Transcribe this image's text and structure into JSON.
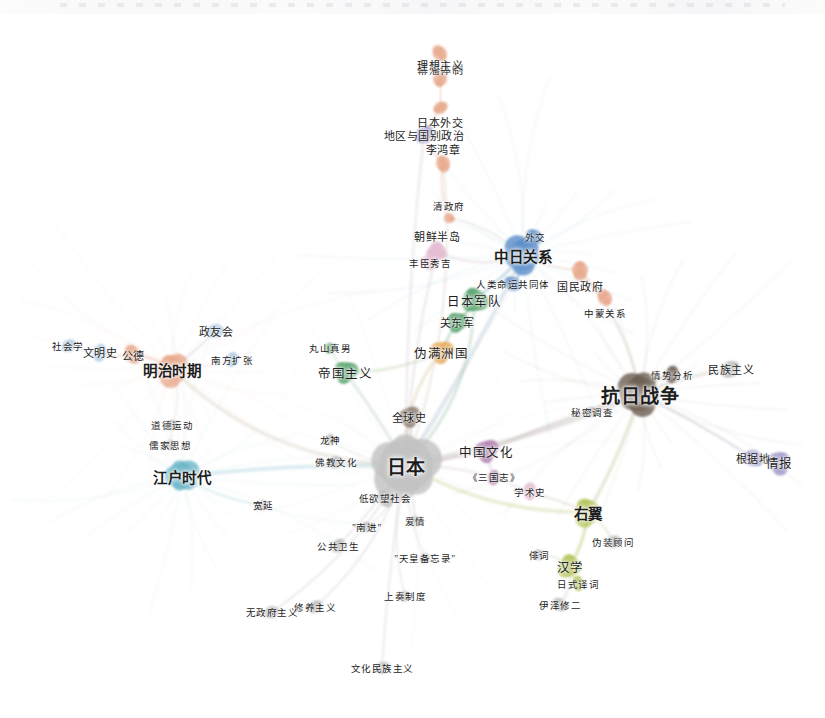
{
  "figure": {
    "type": "network-graph",
    "title": "",
    "background": "#ffffff",
    "width": 825,
    "height": 718
  },
  "palette": {
    "grey": "#b4b4b4",
    "grey_dark": "#9a9a9a",
    "salmon": "#e8a98d",
    "salmon_deep": "#dd9274",
    "blue": "#5b8fc9",
    "blue_light": "#a8c6e2",
    "green": "#58a36d",
    "green_light": "#9dc9a8",
    "orange": "#e8ab5a",
    "pink": "#e3bdd2",
    "mauve": "#b07fae",
    "brown": "#8a7a6d",
    "brown_dark": "#6e5f53",
    "olive": "#b5c45a",
    "purple": "#9a95c8",
    "teal": "#6fb7c9",
    "text": "#1d1d1d"
  },
  "chart_data": {
    "type": "network",
    "node_count": 48,
    "clusters": [
      {
        "name": "core-japan",
        "color": "#b4b4b4",
        "label": "日本"
      },
      {
        "name": "meiji-west",
        "color": "#e8a98d",
        "label": "明治时期"
      },
      {
        "name": "edo-blue",
        "color": "#6fb7c9",
        "label": "江户时代"
      },
      {
        "name": "sino-japanese-relations",
        "color": "#5b8fc9",
        "label": "中日关系"
      },
      {
        "name": "military-green",
        "color": "#58a36d",
        "label": "日本军队"
      },
      {
        "name": "manchukuo-orange",
        "color": "#e8ab5a",
        "label": "伪满洲国"
      },
      {
        "name": "war-brown",
        "color": "#6e5f53",
        "label": "抗日战争"
      },
      {
        "name": "rightwing-olive",
        "color": "#b5c45a",
        "label": "右翼"
      },
      {
        "name": "culture-mauve",
        "color": "#b07fae",
        "label": "中国文化"
      },
      {
        "name": "intel-purple",
        "color": "#9a95c8",
        "label": "情报"
      }
    ],
    "nodes": [
      {
        "id": "mufan",
        "label": "幕藩体制",
        "x": 440,
        "y": 54,
        "r": 7,
        "color": "#e8a98d",
        "size": "sm",
        "label_pos": "below"
      },
      {
        "id": "lixiang",
        "label": "理想主义",
        "x": 440,
        "y": 79,
        "r": 7,
        "color": "#e8a98d",
        "size": "sm",
        "label_pos": "above"
      },
      {
        "id": "ribenwj",
        "label": "日本外交",
        "x": 440,
        "y": 108,
        "r": 6,
        "color": "#e8a98d",
        "size": "sm",
        "label_pos": "below"
      },
      {
        "id": "diqu",
        "label": "地区与国别政治",
        "x": 424,
        "y": 135,
        "r": 8,
        "color": "#9a95c8",
        "size": "sm",
        "label_pos": "on"
      },
      {
        "id": "lihz",
        "label": "李鸿章",
        "x": 443,
        "y": 163,
        "r": 7,
        "color": "#e8a98d",
        "size": "sm",
        "label_pos": "above"
      },
      {
        "id": "qingzf",
        "label": "清政府",
        "x": 449,
        "y": 218,
        "r": 5,
        "color": "#e8a98d",
        "size": "xs",
        "label_pos": "above"
      },
      {
        "id": "chaoxian",
        "label": "朝鲜半岛",
        "x": 437,
        "y": 252,
        "r": 9,
        "color": "#e3bdd2",
        "size": "sm",
        "label_pos": "above"
      },
      {
        "id": "fengchen",
        "label": "丰臣秀吉",
        "x": 430,
        "y": 263,
        "r": 7,
        "color": "#e3bdd2",
        "size": "xs",
        "label_pos": "on"
      },
      {
        "id": "tiaoyue",
        "label": "外交",
        "x": 535,
        "y": 237,
        "r": 7,
        "color": "#5b8fc9",
        "size": "xs",
        "label_pos": "on"
      },
      {
        "id": "zhongri",
        "label": "中日关系",
        "x": 523,
        "y": 255,
        "r": 15,
        "color": "#5b8fc9",
        "size": "lg",
        "label_pos": "on"
      },
      {
        "id": "renlei",
        "label": "人类命运共同体",
        "x": 513,
        "y": 284,
        "r": 7,
        "color": "#5b8fc9",
        "size": "xs",
        "label_pos": "on"
      },
      {
        "id": "guomin",
        "label": "国民政府",
        "x": 580,
        "y": 270,
        "r": 8,
        "color": "#e8a98d",
        "size": "sm",
        "label_pos": "below"
      },
      {
        "id": "zhongmeng",
        "label": "中蒙关系",
        "x": 605,
        "y": 298,
        "r": 7,
        "color": "#e8a98d",
        "size": "xs",
        "label_pos": "below"
      },
      {
        "id": "junduiA",
        "label": "日本军队",
        "x": 474,
        "y": 300,
        "r": 11,
        "color": "#58a36d",
        "size": "md",
        "label_pos": "left"
      },
      {
        "id": "guandong",
        "label": "关东军",
        "x": 457,
        "y": 322,
        "r": 9,
        "color": "#58a36d",
        "size": "sm",
        "label_pos": "on"
      },
      {
        "id": "weiman",
        "label": "伪满洲国",
        "x": 441,
        "y": 352,
        "r": 10,
        "color": "#e8ab5a",
        "size": "md",
        "label_pos": "on"
      },
      {
        "id": "maruyama",
        "label": "丸山真男",
        "x": 330,
        "y": 348,
        "r": 5,
        "color": "#58a36d",
        "size": "xs",
        "label_pos": "on"
      },
      {
        "id": "diguo",
        "label": "帝国主义",
        "x": 345,
        "y": 372,
        "r": 10,
        "color": "#58a36d",
        "size": "md",
        "label_pos": "on"
      },
      {
        "id": "nanfang",
        "label": "南方扩张",
        "x": 232,
        "y": 360,
        "r": 6,
        "color": "#a8c6e2",
        "size": "xs",
        "label_pos": "on"
      },
      {
        "id": "zhengyou",
        "label": "政友会",
        "x": 216,
        "y": 331,
        "r": 7,
        "color": "#a8c6e2",
        "size": "sm",
        "label_pos": "on"
      },
      {
        "id": "mingzhi",
        "label": "明治时期",
        "x": 172,
        "y": 369,
        "r": 13,
        "color": "#e8a98d",
        "size": "lg",
        "label_pos": "on"
      },
      {
        "id": "gongde",
        "label": "公德",
        "x": 133,
        "y": 355,
        "r": 8,
        "color": "#e8a98d",
        "size": "sm",
        "label_pos": "on"
      },
      {
        "id": "wenmingshi",
        "label": "文明史",
        "x": 100,
        "y": 352,
        "r": 7,
        "color": "#a8c6e2",
        "size": "sm",
        "label_pos": "on"
      },
      {
        "id": "shehuixue",
        "label": "社会学",
        "x": 68,
        "y": 346,
        "r": 6,
        "color": "#a8c6e2",
        "size": "xs",
        "label_pos": "on"
      },
      {
        "id": "daode",
        "label": "道德运动",
        "x": 172,
        "y": 425,
        "r": 5,
        "color": "#b4b4b4",
        "size": "xs",
        "label_pos": "on"
      },
      {
        "id": "rujia",
        "label": "儒家思想",
        "x": 170,
        "y": 445,
        "r": 5,
        "color": "#b4b4b4",
        "size": "xs",
        "label_pos": "on"
      },
      {
        "id": "jiangshu",
        "label": "江户时代",
        "x": 182,
        "y": 476,
        "r": 13,
        "color": "#6fb7c9",
        "size": "lg",
        "label_pos": "on"
      },
      {
        "id": "quanqiushi",
        "label": "全球史",
        "x": 409,
        "y": 417,
        "r": 9,
        "color": "#8a7a6d",
        "size": "sm",
        "label_pos": "on"
      },
      {
        "id": "longshen",
        "label": "龙神",
        "x": 330,
        "y": 440,
        "r": 5,
        "color": "#b4b4b4",
        "size": "xs",
        "label_pos": "on"
      },
      {
        "id": "fojiao",
        "label": "佛教文化",
        "x": 336,
        "y": 462,
        "r": 6,
        "color": "#b4b4b4",
        "size": "xs",
        "label_pos": "on"
      },
      {
        "id": "riben",
        "label": "日本",
        "x": 406,
        "y": 465,
        "r": 27,
        "color": "#c2c2c2",
        "size": "xl",
        "label_pos": "on"
      },
      {
        "id": "zhongguowh",
        "label": "中国文化",
        "x": 486,
        "y": 451,
        "r": 10,
        "color": "#b07fae",
        "size": "md",
        "label_pos": "on"
      },
      {
        "id": "sanguozhi",
        "label": "《三国志》",
        "x": 494,
        "y": 477,
        "r": 6,
        "color": "#b07fae",
        "size": "xs",
        "label_pos": "on"
      },
      {
        "id": "diyuwang",
        "label": "低欲望社会",
        "x": 385,
        "y": 498,
        "r": 7,
        "color": "#b4b4b4",
        "size": "xs",
        "label_pos": "on"
      },
      {
        "id": "kuanyan",
        "label": "宽延",
        "x": 263,
        "y": 505,
        "r": 5,
        "color": "#b4b4b4",
        "size": "xs",
        "label_pos": "on"
      },
      {
        "id": "nanjin",
        "label": "\"南进\"",
        "x": 367,
        "y": 527,
        "r": 5,
        "color": "#b4b4b4",
        "size": "xs",
        "label_pos": "on"
      },
      {
        "id": "aiqing",
        "label": "爱情",
        "x": 415,
        "y": 521,
        "r": 5,
        "color": "#b4b4b4",
        "size": "xs",
        "label_pos": "on"
      },
      {
        "id": "gonggong",
        "label": "公共卫生",
        "x": 338,
        "y": 546,
        "r": 6,
        "color": "#b4b4b4",
        "size": "xs",
        "label_pos": "on"
      },
      {
        "id": "tianhuang",
        "label": "\"天皇备忘录\"",
        "x": 425,
        "y": 558,
        "r": 5,
        "color": "#b4b4b4",
        "size": "xs",
        "label_pos": "on"
      },
      {
        "id": "shangzou",
        "label": "上奏制度",
        "x": 405,
        "y": 596,
        "r": 5,
        "color": "#b4b4b4",
        "size": "xs",
        "label_pos": "on"
      },
      {
        "id": "xiuyang",
        "label": "修养主义",
        "x": 315,
        "y": 607,
        "r": 6,
        "color": "#b4b4b4",
        "size": "xs",
        "label_pos": "on"
      },
      {
        "id": "wuzhengfu",
        "label": "无政府主义",
        "x": 272,
        "y": 612,
        "r": 6,
        "color": "#b4b4b4",
        "size": "xs",
        "label_pos": "on"
      },
      {
        "id": "wenhuamz",
        "label": "文化民族主义",
        "x": 382,
        "y": 668,
        "r": 6,
        "color": "#b4b4b4",
        "size": "xs",
        "label_pos": "on"
      },
      {
        "id": "mimi",
        "label": "秘密调查",
        "x": 592,
        "y": 412,
        "r": 5,
        "color": "#b4b4b4",
        "size": "xs",
        "label_pos": "on"
      },
      {
        "id": "fenxi",
        "label": "情势分析",
        "x": 672,
        "y": 375,
        "r": 7,
        "color": "#6e5f53",
        "size": "xs",
        "label_pos": "on"
      },
      {
        "id": "kangri",
        "label": "抗日战争",
        "x": 640,
        "y": 394,
        "r": 17,
        "color": "#6e5f53",
        "size": "xl",
        "label_pos": "on"
      },
      {
        "id": "minzu",
        "label": "民族主义",
        "x": 731,
        "y": 369,
        "r": 8,
        "color": "#b4b4b4",
        "size": "sm",
        "label_pos": "on"
      },
      {
        "id": "genjudi",
        "label": "根据地",
        "x": 753,
        "y": 458,
        "r": 8,
        "color": "#9a95c8",
        "size": "sm",
        "label_pos": "on"
      },
      {
        "id": "qingbao",
        "label": "情报",
        "x": 779,
        "y": 462,
        "r": 10,
        "color": "#9a95c8",
        "size": "md",
        "label_pos": "on"
      },
      {
        "id": "xueshushi",
        "label": "学术史",
        "x": 530,
        "y": 492,
        "r": 7,
        "color": "#e3bdd2",
        "size": "xs",
        "label_pos": "on"
      },
      {
        "id": "youyi",
        "label": "右翼",
        "x": 588,
        "y": 512,
        "r": 12,
        "color": "#b5c45a",
        "size": "lg",
        "label_pos": "on"
      },
      {
        "id": "weizhuang",
        "label": "伪装顾问",
        "x": 613,
        "y": 542,
        "r": 6,
        "color": "#b4b4b4",
        "size": "xs",
        "label_pos": "on"
      },
      {
        "id": "paici",
        "label": "俳词",
        "x": 539,
        "y": 555,
        "r": 5,
        "color": "#b4b4b4",
        "size": "xs",
        "label_pos": "on"
      },
      {
        "id": "hanxue",
        "label": "汉学",
        "x": 570,
        "y": 566,
        "r": 10,
        "color": "#b5c45a",
        "size": "md",
        "label_pos": "on"
      },
      {
        "id": "rishi",
        "label": "日式译词",
        "x": 578,
        "y": 584,
        "r": 6,
        "color": "#b5c45a",
        "size": "xs",
        "label_pos": "on"
      },
      {
        "id": "yize",
        "label": "伊泽修二",
        "x": 560,
        "y": 605,
        "r": 6,
        "color": "#b4b4b4",
        "size": "xs",
        "label_pos": "on"
      }
    ],
    "edges": [
      {
        "source": "mufan",
        "target": "lixiang",
        "color": "#e8a98d"
      },
      {
        "source": "lixiang",
        "target": "ribenwj",
        "color": "#e8a98d"
      },
      {
        "source": "ribenwj",
        "target": "diqu",
        "color": "#e8a98d"
      },
      {
        "source": "diqu",
        "target": "lihz",
        "color": "#e8a98d"
      },
      {
        "source": "lihz",
        "target": "qingzf",
        "color": "#e8a98d"
      },
      {
        "source": "qingzf",
        "target": "zhongri",
        "color": "#cfc9bd"
      },
      {
        "source": "lihz",
        "target": "riben",
        "color": "#d9cfc6"
      },
      {
        "source": "diqu",
        "target": "riben",
        "color": "#d4cfd8"
      },
      {
        "source": "chaoxian",
        "target": "riben",
        "color": "#e0cfd8"
      },
      {
        "source": "chaoxian",
        "target": "zhongri",
        "color": "#dfd4d9"
      },
      {
        "source": "zhongri",
        "target": "renlei",
        "color": "#5b8fc9"
      },
      {
        "source": "zhongri",
        "target": "tiaoyue",
        "color": "#5b8fc9"
      },
      {
        "source": "zhongri",
        "target": "riben",
        "color": "#b9c7d6"
      },
      {
        "source": "zhongri",
        "target": "guomin",
        "color": "#d8c6bb"
      },
      {
        "source": "guomin",
        "target": "zhongmeng",
        "color": "#e8a98d"
      },
      {
        "source": "guomin",
        "target": "kangri",
        "color": "#cfc0b2"
      },
      {
        "source": "junduiA",
        "target": "guandong",
        "color": "#58a36d"
      },
      {
        "source": "guandong",
        "target": "weiman",
        "color": "#88bd96"
      },
      {
        "source": "junduiA",
        "target": "zhongri",
        "color": "#8fb3c8"
      },
      {
        "source": "weiman",
        "target": "riben",
        "color": "#ddc9a8"
      },
      {
        "source": "junduiA",
        "target": "riben",
        "color": "#aac7b2"
      },
      {
        "source": "diguo",
        "target": "maruyama",
        "color": "#9dc9a8"
      },
      {
        "source": "diguo",
        "target": "riben",
        "color": "#bdd2c2"
      },
      {
        "source": "diguo",
        "target": "weiman",
        "color": "#bcd0ae"
      },
      {
        "source": "mingzhi",
        "target": "gongde",
        "color": "#e8a98d"
      },
      {
        "source": "gongde",
        "target": "wenmingshi",
        "color": "#d9bda6"
      },
      {
        "source": "wenmingshi",
        "target": "shehuixue",
        "color": "#a8c6e2"
      },
      {
        "source": "mingzhi",
        "target": "zhengyou",
        "color": "#c9cbd6"
      },
      {
        "source": "mingzhi",
        "target": "nanfang",
        "color": "#d4c6bd"
      },
      {
        "source": "mingzhi",
        "target": "riben",
        "color": "#ddd2c6"
      },
      {
        "source": "mingzhi",
        "target": "daode",
        "color": "#ddd6cd"
      },
      {
        "source": "daode",
        "target": "rujia",
        "color": "#cfcfcf"
      },
      {
        "source": "jiangshu",
        "target": "riben",
        "color": "#a9d2de"
      },
      {
        "source": "jiangshu",
        "target": "kuanyan",
        "color": "#a9d2de"
      },
      {
        "source": "riben",
        "target": "quanqiushi",
        "color": "#c2b9b0"
      },
      {
        "source": "riben",
        "target": "longshen",
        "color": "#cccccc"
      },
      {
        "source": "riben",
        "target": "fojiao",
        "color": "#cccccc"
      },
      {
        "source": "riben",
        "target": "zhongguowh",
        "color": "#d3bcd0"
      },
      {
        "source": "zhongguowh",
        "target": "sanguozhi",
        "color": "#c9a9c4"
      },
      {
        "source": "riben",
        "target": "diyuwang",
        "color": "#cccccc"
      },
      {
        "source": "riben",
        "target": "nanjin",
        "color": "#cccccc"
      },
      {
        "source": "riben",
        "target": "aiqing",
        "color": "#cccccc"
      },
      {
        "source": "riben",
        "target": "gonggong",
        "color": "#cccccc"
      },
      {
        "source": "riben",
        "target": "tianhuang",
        "color": "#cccccc"
      },
      {
        "source": "riben",
        "target": "shangzou",
        "color": "#cccccc"
      },
      {
        "source": "riben",
        "target": "xiuyang",
        "color": "#cccccc"
      },
      {
        "source": "riben",
        "target": "wuzhengfu",
        "color": "#cccccc"
      },
      {
        "source": "riben",
        "target": "wenhuamz",
        "color": "#cccccc"
      },
      {
        "source": "riben",
        "target": "kangri",
        "color": "#c5bcb4"
      },
      {
        "source": "kangri",
        "target": "mimi",
        "color": "#c0b8af"
      },
      {
        "source": "kangri",
        "target": "fenxi",
        "color": "#6e5f53"
      },
      {
        "source": "kangri",
        "target": "minzu",
        "color": "#c4c0ba"
      },
      {
        "source": "kangri",
        "target": "genjudi",
        "color": "#b8b3c6"
      },
      {
        "source": "genjudi",
        "target": "qingbao",
        "color": "#9a95c8"
      },
      {
        "source": "riben",
        "target": "youyi",
        "color": "#ccd49a"
      },
      {
        "source": "youyi",
        "target": "weizhuang",
        "color": "#c2cc9c"
      },
      {
        "source": "youyi",
        "target": "hanxue",
        "color": "#b5c45a"
      },
      {
        "source": "youyi",
        "target": "xueshushi",
        "color": "#d6cbb8"
      },
      {
        "source": "hanxue",
        "target": "rishi",
        "color": "#b5c45a"
      },
      {
        "source": "hanxue",
        "target": "paici",
        "color": "#c6cbb0"
      },
      {
        "source": "hanxue",
        "target": "yize",
        "color": "#c4c4b8"
      },
      {
        "source": "kangri",
        "target": "youyi",
        "color": "#c8cda4"
      },
      {
        "source": "zhongguowh",
        "target": "kangri",
        "color": "#cbbcc4"
      },
      {
        "source": "xueshushi",
        "target": "riben",
        "color": "#ddcdd6"
      }
    ]
  }
}
